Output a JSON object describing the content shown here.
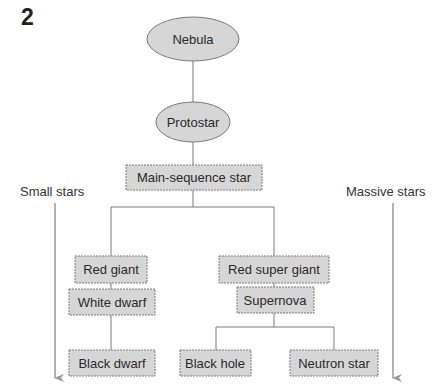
{
  "figure": {
    "number": "2"
  },
  "labels": {
    "small_stars": "Small stars",
    "massive_stars": "Massive stars"
  },
  "nodes": {
    "nebula": "Nebula",
    "protostar": "Protostar",
    "main_sequence": "Main-sequence star",
    "red_giant": "Red giant",
    "red_super_giant": "Red super giant",
    "white_dwarf": "White dwarf",
    "supernova": "Supernova",
    "black_dwarf": "Black dwarf",
    "black_hole": "Black hole",
    "neutron_star": "Neutron star"
  },
  "colors": {
    "node_fill": "#d6d6d6",
    "node_stroke": "#7a7a7a",
    "line": "#7a7a7a",
    "arrow": "#9a9a9a"
  }
}
